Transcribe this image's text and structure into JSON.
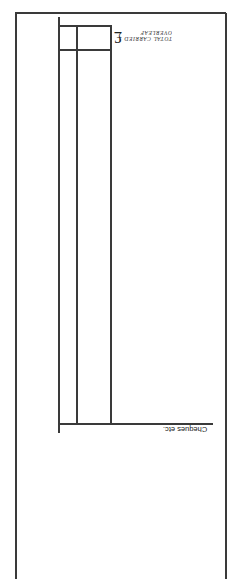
{
  "document": {
    "orientation": "rotated 180 degrees",
    "total_box": {
      "currency_symbol": "£",
      "label_line1": "TOTAL CARRIED",
      "label_line2": "OVERLEAF"
    },
    "column_label": "Cheques etc.",
    "colors": {
      "line": "#3a3a3a",
      "paper": "#ffffff",
      "text": "#222222"
    }
  }
}
